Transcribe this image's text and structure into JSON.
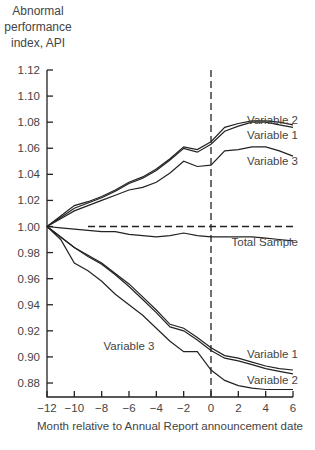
{
  "chart_data": {
    "type": "line",
    "title": "",
    "ylabel_lines": [
      "Abnormal",
      "performance",
      "index, API"
    ],
    "xlabel": "Month relative to Annual Report announcement date",
    "xlim": [
      -12,
      6
    ],
    "ylim": [
      0.87,
      1.12
    ],
    "xticks": [
      -12,
      -10,
      -8,
      -6,
      -4,
      -2,
      0,
      2,
      4,
      6
    ],
    "xtick_labels": [
      "−12",
      "−10",
      "−8",
      "−6",
      "−4",
      "−2",
      "0",
      "2",
      "4",
      "6"
    ],
    "yticks": [
      0.88,
      0.9,
      0.92,
      0.94,
      0.96,
      0.98,
      1.0,
      1.02,
      1.04,
      1.06,
      1.08,
      1.1,
      1.12
    ],
    "ytick_labels": [
      "0.88",
      "0.90",
      "0.92",
      "0.94",
      "0.96",
      "0.98",
      "1.00",
      "1.02",
      "1.04",
      "1.06",
      "1.08",
      "1.10",
      "1.12"
    ],
    "grid": false,
    "reference_lines": [
      {
        "orientation": "horizontal",
        "value": 1.0,
        "x_from": -9,
        "x_to": 6,
        "style": "dashed"
      },
      {
        "orientation": "vertical",
        "value": 0,
        "style": "dashed"
      }
    ],
    "x": [
      -12,
      -11,
      -10,
      -9,
      -8,
      -7,
      -6,
      -5,
      -4,
      -3,
      -2,
      -1,
      0,
      1,
      2,
      3,
      4,
      5,
      6
    ],
    "series": [
      {
        "name": "Variable 2",
        "group": "upper",
        "label_pos": [
          6,
          1.082
        ],
        "values": [
          1.0,
          1.008,
          1.016,
          1.019,
          1.023,
          1.028,
          1.034,
          1.038,
          1.044,
          1.052,
          1.061,
          1.059,
          1.065,
          1.076,
          1.079,
          1.081,
          1.081,
          1.08,
          1.078
        ]
      },
      {
        "name": "Variable 1",
        "group": "upper",
        "label_pos": [
          6,
          1.07
        ],
        "values": [
          1.0,
          1.007,
          1.014,
          1.018,
          1.022,
          1.027,
          1.033,
          1.037,
          1.043,
          1.051,
          1.06,
          1.057,
          1.063,
          1.073,
          1.077,
          1.08,
          1.08,
          1.078,
          1.076
        ]
      },
      {
        "name": "Variable 3",
        "group": "upper",
        "label_pos": [
          6,
          1.05
        ],
        "values": [
          1.0,
          1.006,
          1.012,
          1.016,
          1.02,
          1.024,
          1.028,
          1.03,
          1.034,
          1.041,
          1.05,
          1.046,
          1.047,
          1.058,
          1.059,
          1.061,
          1.061,
          1.058,
          1.054
        ]
      },
      {
        "name": "Total Sample",
        "group": "middle",
        "label_pos": [
          6,
          0.988
        ],
        "values": [
          1.0,
          0.999,
          0.998,
          0.997,
          0.996,
          0.996,
          0.994,
          0.993,
          0.992,
          0.993,
          0.995,
          0.993,
          0.992,
          0.992,
          0.992,
          0.992,
          0.991,
          0.99,
          0.989
        ]
      },
      {
        "name": "Variable 1",
        "group": "lower",
        "label_pos": [
          6,
          0.902
        ],
        "values": [
          1.0,
          0.992,
          0.984,
          0.978,
          0.972,
          0.964,
          0.956,
          0.946,
          0.936,
          0.925,
          0.922,
          0.915,
          0.907,
          0.901,
          0.899,
          0.896,
          0.893,
          0.891,
          0.89
        ]
      },
      {
        "name": "Variable 2",
        "group": "lower",
        "label_pos": [
          6,
          0.882
        ],
        "values": [
          1.0,
          0.992,
          0.984,
          0.977,
          0.971,
          0.963,
          0.954,
          0.944,
          0.934,
          0.923,
          0.92,
          0.913,
          0.905,
          0.899,
          0.897,
          0.894,
          0.891,
          0.889,
          0.887
        ]
      },
      {
        "name": "Variable 3",
        "group": "lower",
        "label_pos": [
          -6,
          0.908
        ],
        "values": [
          1.0,
          0.99,
          0.972,
          0.966,
          0.958,
          0.948,
          0.94,
          0.932,
          0.922,
          0.912,
          0.904,
          0.904,
          0.89,
          0.882,
          0.878,
          0.876,
          0.875,
          0.875,
          0.875
        ]
      }
    ]
  }
}
